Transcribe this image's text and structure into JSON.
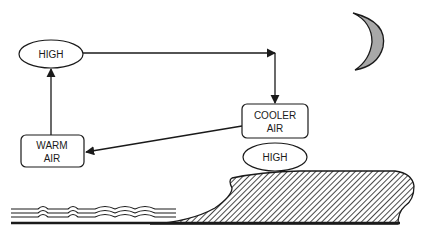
{
  "diagram": {
    "type": "land-breeze-circulation",
    "nodes": {
      "high_upper": {
        "label": "HIGH",
        "shape": "ellipse"
      },
      "cooler_air": {
        "line1": "COOLER",
        "line2": "AIR",
        "shape": "rounded-box"
      },
      "high_lower": {
        "label": "HIGH",
        "shape": "ellipse"
      },
      "warm_air": {
        "line1": "WARM",
        "line2": "AIR",
        "shape": "rounded-box"
      }
    },
    "edges": [
      {
        "from": "high_upper",
        "to": "cooler_air"
      },
      {
        "from": "cooler_air",
        "to": "warm_air"
      },
      {
        "from": "warm_air",
        "to": "high_upper"
      }
    ],
    "scene": {
      "sky_icon": "crescent-moon",
      "left_surface": "water",
      "right_surface": "land"
    },
    "colors": {
      "stroke": "#1a1a1a",
      "moon_fill": "#a8a8a8",
      "background": "#ffffff"
    }
  }
}
